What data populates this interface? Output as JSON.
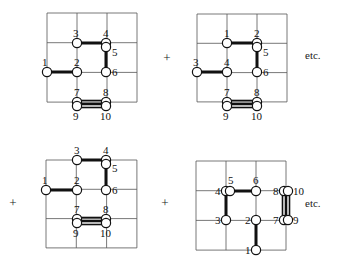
{
  "operators": [
    {
      "symbol": "+",
      "x": 167,
      "y": 62
    },
    {
      "symbol": "+",
      "x": 13,
      "y": 207
    },
    {
      "symbol": "+",
      "x": 165,
      "y": 207
    }
  ],
  "etc": [
    {
      "text": "etc.",
      "x": 305,
      "y": 59
    },
    {
      "text": "etc.",
      "x": 305,
      "y": 207
    }
  ],
  "panels": [
    {
      "name": "panel-top-left",
      "grid": {
        "x0": 47,
        "y0": 13,
        "dx": 30,
        "dy": 29.7,
        "cols": 3,
        "rows": 3
      },
      "nodes": [
        {
          "id": "1",
          "x": 47,
          "y": 72,
          "lx": 42,
          "ly": 66
        },
        {
          "id": "2",
          "x": 77,
          "y": 72,
          "lx": 74,
          "ly": 66
        },
        {
          "id": "3",
          "x": 77,
          "y": 43,
          "lx": 73,
          "ly": 37
        },
        {
          "id": "4",
          "x": 106,
          "y": 43,
          "lx": 103,
          "ly": 37
        },
        {
          "id": "5",
          "x": 106,
          "y": 47,
          "lx": 112,
          "ly": 56
        },
        {
          "id": "6",
          "x": 106,
          "y": 72,
          "lx": 112,
          "ly": 76
        },
        {
          "id": "7",
          "x": 77,
          "y": 102,
          "lx": 74,
          "ly": 96
        },
        {
          "id": "8",
          "x": 106,
          "y": 102,
          "lx": 103,
          "ly": 96
        },
        {
          "id": "9",
          "x": 77,
          "y": 106,
          "lx": 73,
          "ly": 120
        },
        {
          "id": "10",
          "x": 106,
          "y": 106,
          "lx": 100,
          "ly": 120
        }
      ],
      "bonds": [
        [
          "1",
          "2"
        ],
        [
          "3",
          "4"
        ],
        [
          "5",
          "6"
        ]
      ],
      "double_bonds": [
        [
          "7",
          "8"
        ],
        [
          "9",
          "10"
        ]
      ]
    },
    {
      "name": "panel-top-right",
      "grid": {
        "x0": 197,
        "y0": 14,
        "dx": 30,
        "dy": 29.3,
        "cols": 3,
        "rows": 3
      },
      "nodes": [
        {
          "id": "3",
          "x": 197,
          "y": 72,
          "lx": 193,
          "ly": 66
        },
        {
          "id": "4",
          "x": 227,
          "y": 72,
          "lx": 224,
          "ly": 66
        },
        {
          "id": "1",
          "x": 227,
          "y": 43,
          "lx": 224,
          "ly": 37
        },
        {
          "id": "2",
          "x": 257,
          "y": 43,
          "lx": 254,
          "ly": 37
        },
        {
          "id": "5",
          "x": 257,
          "y": 47,
          "lx": 263,
          "ly": 56
        },
        {
          "id": "6",
          "x": 257,
          "y": 72,
          "lx": 263,
          "ly": 76
        },
        {
          "id": "7",
          "x": 227,
          "y": 102,
          "lx": 224,
          "ly": 96
        },
        {
          "id": "8",
          "x": 257,
          "y": 102,
          "lx": 254,
          "ly": 96
        },
        {
          "id": "9",
          "x": 227,
          "y": 106,
          "lx": 223,
          "ly": 120
        },
        {
          "id": "10",
          "x": 257,
          "y": 106,
          "lx": 251,
          "ly": 120
        }
      ],
      "bonds": [
        [
          "3",
          "4"
        ],
        [
          "1",
          "2"
        ],
        [
          "5",
          "6"
        ]
      ],
      "double_bonds": [
        [
          "7",
          "8"
        ],
        [
          "9",
          "10"
        ]
      ]
    },
    {
      "name": "panel-bottom-left",
      "grid": {
        "x0": 46,
        "y0": 160,
        "dx": 30.3,
        "dy": 29.3,
        "cols": 3,
        "rows": 3
      },
      "nodes": [
        {
          "id": "1",
          "x": 46,
          "y": 190,
          "lx": 42,
          "ly": 184
        },
        {
          "id": "2",
          "x": 77,
          "y": 190,
          "lx": 74,
          "ly": 184
        },
        {
          "id": "3",
          "x": 77,
          "y": 160,
          "lx": 74,
          "ly": 154
        },
        {
          "id": "4",
          "x": 106,
          "y": 160,
          "lx": 103,
          "ly": 154
        },
        {
          "id": "5",
          "x": 106,
          "y": 164,
          "lx": 112,
          "ly": 172
        },
        {
          "id": "6",
          "x": 106,
          "y": 190,
          "lx": 112,
          "ly": 194
        },
        {
          "id": "7",
          "x": 77,
          "y": 219,
          "lx": 74,
          "ly": 213
        },
        {
          "id": "8",
          "x": 106,
          "y": 219,
          "lx": 103,
          "ly": 213
        },
        {
          "id": "9",
          "x": 77,
          "y": 223,
          "lx": 73,
          "ly": 237
        },
        {
          "id": "10",
          "x": 106,
          "y": 223,
          "lx": 100,
          "ly": 237
        }
      ],
      "bonds": [
        [
          "1",
          "2"
        ],
        [
          "3",
          "4"
        ],
        [
          "5",
          "6"
        ]
      ],
      "double_bonds": [
        [
          "7",
          "8"
        ],
        [
          "9",
          "10"
        ]
      ]
    },
    {
      "name": "panel-bottom-right",
      "grid": {
        "x0": 196,
        "y0": 161,
        "dx": 30,
        "dy": 29.7,
        "cols": 3,
        "rows": 3
      },
      "nodes": [
        {
          "id": "4",
          "x": 226,
          "y": 191,
          "lx": 215,
          "ly": 195
        },
        {
          "id": "5",
          "x": 230,
          "y": 191,
          "lx": 228,
          "ly": 184
        },
        {
          "id": "6",
          "x": 256,
          "y": 191,
          "lx": 253,
          "ly": 184
        },
        {
          "id": "8",
          "x": 284,
          "y": 191,
          "lx": 273,
          "ly": 195
        },
        {
          "id": "10",
          "x": 288,
          "y": 191,
          "lx": 293,
          "ly": 195
        },
        {
          "id": "3",
          "x": 226,
          "y": 220,
          "lx": 215,
          "ly": 224
        },
        {
          "id": "2",
          "x": 256,
          "y": 220,
          "lx": 245,
          "ly": 224
        },
        {
          "id": "7",
          "x": 284,
          "y": 220,
          "lx": 273,
          "ly": 224
        },
        {
          "id": "9",
          "x": 288,
          "y": 220,
          "lx": 293,
          "ly": 224
        },
        {
          "id": "1",
          "x": 256,
          "y": 250,
          "lx": 245,
          "ly": 254
        }
      ],
      "bonds": [
        [
          "5",
          "6"
        ],
        [
          "4",
          "3"
        ],
        [
          "2",
          "1"
        ]
      ],
      "double_bonds_vertical": [
        [
          "8",
          "7"
        ],
        [
          "10",
          "9"
        ]
      ]
    }
  ]
}
